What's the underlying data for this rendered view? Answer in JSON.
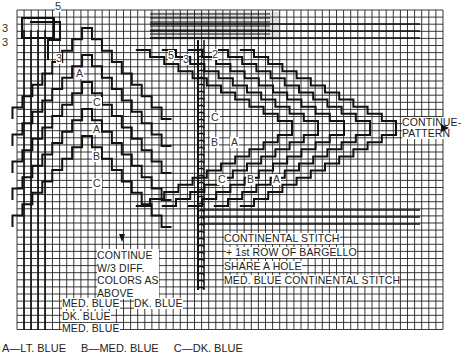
{
  "diagram": {
    "grid": {
      "x0": 17,
      "y0": 10,
      "cell": 7.1,
      "cols": 60,
      "rows": 45
    },
    "top_numbers": [
      {
        "id": "n5-top",
        "text": "5",
        "x": 55,
        "y": 1
      },
      {
        "id": "n3-left-a",
        "text": "3",
        "x": 2,
        "y": 23
      },
      {
        "id": "n3-left-b",
        "text": "3",
        "x": 2,
        "y": 37
      },
      {
        "id": "n3-under",
        "text": "3",
        "x": 56,
        "y": 53
      },
      {
        "id": "n5-mid",
        "text": "5",
        "x": 168,
        "y": 50
      },
      {
        "id": "n3-mid",
        "text": "3",
        "x": 183,
        "y": 54
      },
      {
        "id": "n2-mid",
        "text": "2",
        "x": 212,
        "y": 49
      }
    ],
    "left_peak_letters": [
      {
        "text": "A",
        "x": 75,
        "y": 68
      },
      {
        "text": "C",
        "x": 92,
        "y": 97
      },
      {
        "text": "A",
        "x": 92,
        "y": 124
      },
      {
        "text": "B",
        "x": 92,
        "y": 151
      },
      {
        "text": "C",
        "x": 92,
        "y": 178
      }
    ],
    "right_peak_letters": [
      {
        "text": "C",
        "x": 210,
        "y": 112
      },
      {
        "text": "B",
        "x": 210,
        "y": 137
      },
      {
        "text": "A",
        "x": 230,
        "y": 137
      },
      {
        "text": "C",
        "x": 217,
        "y": 174
      },
      {
        "text": "B",
        "x": 246,
        "y": 174
      },
      {
        "text": "A",
        "x": 272,
        "y": 174
      }
    ],
    "annotations": {
      "continue_pattern": [
        "CONTINUE-",
        "PATTERN"
      ],
      "continue_colors": [
        "CONTINUE",
        "W/3 DIFF.",
        "COLORS AS",
        "ABOVE"
      ],
      "continental_stitch": "CONTINENTAL STITCH",
      "first_row": "+ 1st ROW OF BARGELLO",
      "share_hole": "SHARE A HOLE",
      "med_blue_continental": "MED. BLUE CONTINENTAL STITCH",
      "med_blue_1": "MED. BLUE",
      "dk_blue_1": "DK. BLUE",
      "dk_blue_2": "DK. BLUE",
      "med_blue_2": "MED. BLUE"
    },
    "legend": {
      "a": "A—LT. BLUE",
      "b": "B—MED. BLUE",
      "c": "C—DK. BLUE"
    },
    "colors": {
      "ink": "#111111",
      "grid": "#222222",
      "paper": "#ffffff"
    }
  }
}
